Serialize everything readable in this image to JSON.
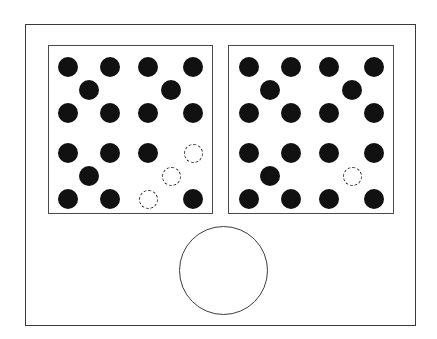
{
  "figure": {
    "canvas": {
      "width": 437,
      "height": 339,
      "background": "#ffffff"
    },
    "outer_frame": {
      "label": "outer-enclosure",
      "x": 25,
      "y": 24,
      "width": 391,
      "height": 302,
      "stroke": "#3a3a3a",
      "stroke_width": 1.4
    },
    "big_circle": {
      "label": "large-open-circle",
      "cx": 223.5,
      "cy": 270.5,
      "r": 44.5,
      "stroke": "#3d3d3d",
      "stroke_width": 1.4,
      "fill": "#ffffff"
    },
    "colors": {
      "atom_fill": "#111111",
      "vacancy_stroke": "#2b2b2b",
      "panel_stroke": "#4a4a4a",
      "frame_stroke": "#3a3a3a",
      "background": "#ffffff"
    },
    "dot_geometry": {
      "filled_diameter": 20,
      "vacancy_diameter": 19,
      "vacancy_dash_width": 1.7
    },
    "panels": [
      {
        "name": "left-panel",
        "x": 48,
        "y": 45,
        "width": 165,
        "height": 169,
        "filled_count": 19,
        "vacancy_count": 3,
        "dots": [
          {
            "id": "L-r1-c1",
            "cx": 67,
            "cy": 66,
            "state": "filled"
          },
          {
            "id": "L-r1-c2",
            "cx": 109,
            "cy": 66,
            "state": "filled"
          },
          {
            "id": "L-r1-c3",
            "cx": 147,
            "cy": 66,
            "state": "filled"
          },
          {
            "id": "L-r1-c4",
            "cx": 192,
            "cy": 66,
            "state": "filled"
          },
          {
            "id": "L-r2-c2",
            "cx": 88,
            "cy": 89,
            "state": "filled"
          },
          {
            "id": "L-r2-c4",
            "cx": 170,
            "cy": 89,
            "state": "filled"
          },
          {
            "id": "L-r3-c1",
            "cx": 67,
            "cy": 112,
            "state": "filled"
          },
          {
            "id": "L-r3-c2",
            "cx": 109,
            "cy": 112,
            "state": "filled"
          },
          {
            "id": "L-r3-c3",
            "cx": 147,
            "cy": 112,
            "state": "filled"
          },
          {
            "id": "L-r3-c4",
            "cx": 192,
            "cy": 112,
            "state": "filled"
          },
          {
            "id": "L-r4-c1",
            "cx": 67,
            "cy": 152,
            "state": "filled"
          },
          {
            "id": "L-r4-c2",
            "cx": 109,
            "cy": 152,
            "state": "filled"
          },
          {
            "id": "L-r4-c3",
            "cx": 147,
            "cy": 152,
            "state": "filled"
          },
          {
            "id": "L-r4-c4",
            "cx": 192,
            "cy": 152,
            "state": "vacancy"
          },
          {
            "id": "L-r5-c2",
            "cx": 88,
            "cy": 175,
            "state": "filled"
          },
          {
            "id": "L-r5-c4",
            "cx": 170,
            "cy": 175,
            "state": "vacancy"
          },
          {
            "id": "L-r6-c1",
            "cx": 67,
            "cy": 198,
            "state": "filled"
          },
          {
            "id": "L-r6-c2",
            "cx": 109,
            "cy": 198,
            "state": "filled"
          },
          {
            "id": "L-r6-c3",
            "cx": 147,
            "cy": 198,
            "state": "vacancy"
          },
          {
            "id": "L-r6-c4",
            "cx": 192,
            "cy": 198,
            "state": "filled"
          }
        ]
      },
      {
        "name": "right-panel",
        "x": 228,
        "y": 45,
        "width": 166,
        "height": 169,
        "filled_count": 19,
        "vacancy_count": 1,
        "dots": [
          {
            "id": "R-r1-c1",
            "cx": 248,
            "cy": 66,
            "state": "filled"
          },
          {
            "id": "R-r1-c2",
            "cx": 290,
            "cy": 66,
            "state": "filled"
          },
          {
            "id": "R-r1-c3",
            "cx": 328,
            "cy": 66,
            "state": "filled"
          },
          {
            "id": "R-r1-c4",
            "cx": 373,
            "cy": 66,
            "state": "filled"
          },
          {
            "id": "R-r2-c2",
            "cx": 269,
            "cy": 89,
            "state": "filled"
          },
          {
            "id": "R-r2-c4",
            "cx": 351,
            "cy": 89,
            "state": "filled"
          },
          {
            "id": "R-r3-c1",
            "cx": 248,
            "cy": 112,
            "state": "filled"
          },
          {
            "id": "R-r3-c2",
            "cx": 290,
            "cy": 112,
            "state": "filled"
          },
          {
            "id": "R-r3-c3",
            "cx": 328,
            "cy": 112,
            "state": "filled"
          },
          {
            "id": "R-r3-c4",
            "cx": 373,
            "cy": 112,
            "state": "filled"
          },
          {
            "id": "R-r4-c1",
            "cx": 248,
            "cy": 152,
            "state": "filled"
          },
          {
            "id": "R-r4-c2",
            "cx": 290,
            "cy": 152,
            "state": "filled"
          },
          {
            "id": "R-r4-c3",
            "cx": 328,
            "cy": 152,
            "state": "filled"
          },
          {
            "id": "R-r4-c4",
            "cx": 373,
            "cy": 152,
            "state": "filled"
          },
          {
            "id": "R-r5-c2",
            "cx": 269,
            "cy": 175,
            "state": "filled"
          },
          {
            "id": "R-r5-c4",
            "cx": 351,
            "cy": 175,
            "state": "vacancy"
          },
          {
            "id": "R-r6-c1",
            "cx": 248,
            "cy": 198,
            "state": "filled"
          },
          {
            "id": "R-r6-c2",
            "cx": 290,
            "cy": 198,
            "state": "filled"
          },
          {
            "id": "R-r6-c3",
            "cx": 328,
            "cy": 198,
            "state": "filled"
          },
          {
            "id": "R-r6-c4",
            "cx": 373,
            "cy": 198,
            "state": "filled"
          }
        ]
      }
    ]
  }
}
